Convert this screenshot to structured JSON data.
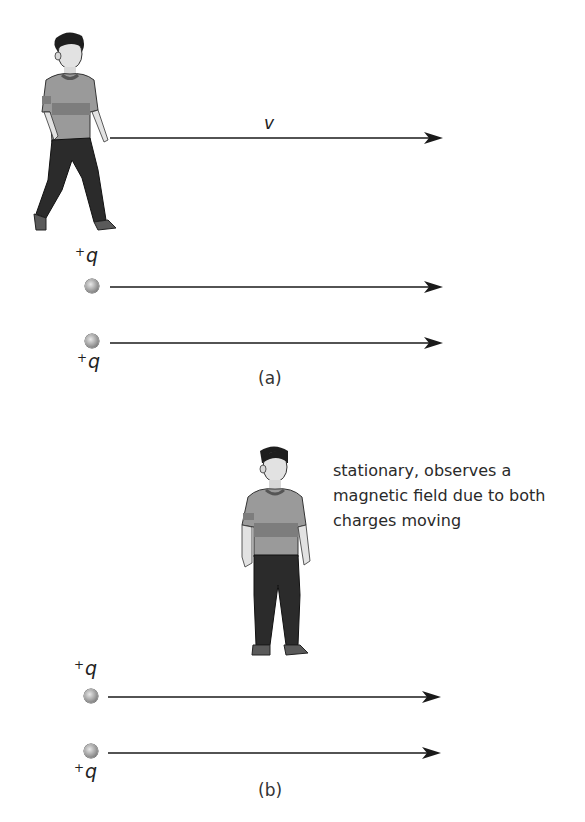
{
  "panels": [
    {
      "id": "a",
      "caption": "(a)",
      "observer": {
        "state": "walking",
        "velocity_label": "v"
      },
      "charges": [
        {
          "label_sign": "+",
          "label_symbol": "q",
          "label_position": "above"
        },
        {
          "label_sign": "+",
          "label_symbol": "q",
          "label_position": "below"
        }
      ]
    },
    {
      "id": "b",
      "caption": "(b)",
      "observer": {
        "state": "standing",
        "note": "stationary, observes a magnetic field due to both charges moving"
      },
      "charges": [
        {
          "label_sign": "+",
          "label_symbol": "q",
          "label_position": "above"
        },
        {
          "label_sign": "+",
          "label_symbol": "q",
          "label_position": "below"
        }
      ]
    }
  ],
  "colors": {
    "arrow": "#1a1a1a",
    "shirt": "#9a9a9a",
    "shirt_band": "#7d7d7d",
    "pants": "#2b2b2b",
    "skin": "#e2e2e2",
    "hair": "#1e1e1e"
  }
}
